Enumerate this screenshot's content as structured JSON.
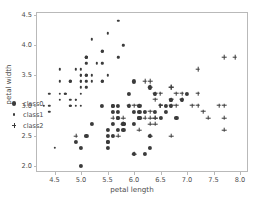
{
  "chart_data": {
    "type": "scatter",
    "title": "",
    "xlabel": "petal length",
    "ylabel": "petal width",
    "xlim": [
      4.15,
      8.15
    ],
    "ylim": [
      1.9,
      4.55
    ],
    "xticks": [
      "4.5",
      "5.0",
      "5.5",
      "6.0",
      "6.5",
      "7.0",
      "7.5",
      "8.0"
    ],
    "xtick_values": [
      4.5,
      5.0,
      5.5,
      6.0,
      6.5,
      7.0,
      7.5,
      8.0
    ],
    "yticks": [
      "2.0",
      "2.5",
      "3.0",
      "3.5",
      "4.0",
      "4.5"
    ],
    "ytick_values": [
      2.0,
      2.5,
      3.0,
      3.5,
      4.0,
      4.5
    ],
    "grid": false,
    "legend_position": "lower left",
    "marker_color": "#3b3b3b",
    "frame_color": "#b9b9b9",
    "series": [
      {
        "name": "class0",
        "marker": "circle",
        "points": [
          [
            7.0,
            3.2
          ],
          [
            6.4,
            3.2
          ],
          [
            6.9,
            3.1
          ],
          [
            5.5,
            2.3
          ],
          [
            6.5,
            2.8
          ],
          [
            5.7,
            2.8
          ],
          [
            6.3,
            3.3
          ],
          [
            4.9,
            2.4
          ],
          [
            6.6,
            2.9
          ],
          [
            5.2,
            2.7
          ],
          [
            5.0,
            2.0
          ],
          [
            5.9,
            3.0
          ],
          [
            6.0,
            2.2
          ],
          [
            6.1,
            2.9
          ],
          [
            5.6,
            2.9
          ],
          [
            6.7,
            3.1
          ],
          [
            5.6,
            3.0
          ],
          [
            5.8,
            2.7
          ],
          [
            6.2,
            2.2
          ],
          [
            5.6,
            2.5
          ],
          [
            5.9,
            3.2
          ],
          [
            6.1,
            2.8
          ],
          [
            6.3,
            2.5
          ],
          [
            6.1,
            2.8
          ],
          [
            6.4,
            2.9
          ],
          [
            6.6,
            3.0
          ],
          [
            6.8,
            2.8
          ],
          [
            6.7,
            3.0
          ],
          [
            6.0,
            2.9
          ],
          [
            5.7,
            2.6
          ],
          [
            5.5,
            2.4
          ],
          [
            5.5,
            2.4
          ],
          [
            5.8,
            2.7
          ],
          [
            6.0,
            2.7
          ],
          [
            5.4,
            3.0
          ],
          [
            6.0,
            3.4
          ],
          [
            6.7,
            3.1
          ],
          [
            6.3,
            2.3
          ],
          [
            5.6,
            3.0
          ],
          [
            5.5,
            2.5
          ],
          [
            5.5,
            2.6
          ],
          [
            6.1,
            3.0
          ],
          [
            5.8,
            2.6
          ],
          [
            5.0,
            2.3
          ],
          [
            5.6,
            2.7
          ],
          [
            5.7,
            3.0
          ],
          [
            5.7,
            2.9
          ],
          [
            6.2,
            2.9
          ],
          [
            5.1,
            2.5
          ],
          [
            5.7,
            2.8
          ]
        ]
      },
      {
        "name": "class1",
        "marker": "dot",
        "points": [
          [
            5.1,
            3.5
          ],
          [
            4.9,
            3.0
          ],
          [
            4.7,
            3.2
          ],
          [
            4.6,
            3.1
          ],
          [
            5.0,
            3.6
          ],
          [
            5.4,
            3.9
          ],
          [
            4.6,
            3.4
          ],
          [
            5.0,
            3.4
          ],
          [
            4.4,
            2.9
          ],
          [
            4.9,
            3.1
          ],
          [
            5.4,
            3.7
          ],
          [
            4.8,
            3.4
          ],
          [
            4.8,
            3.0
          ],
          [
            4.3,
            3.0
          ],
          [
            5.8,
            4.0
          ],
          [
            5.7,
            4.4
          ],
          [
            5.4,
            3.9
          ],
          [
            5.1,
            3.5
          ],
          [
            5.7,
            3.8
          ],
          [
            5.1,
            3.8
          ],
          [
            5.4,
            3.4
          ],
          [
            5.1,
            3.7
          ],
          [
            4.6,
            3.6
          ],
          [
            5.1,
            3.3
          ],
          [
            4.8,
            3.4
          ],
          [
            5.0,
            3.0
          ],
          [
            5.0,
            3.4
          ],
          [
            5.2,
            3.5
          ],
          [
            5.2,
            3.4
          ],
          [
            4.7,
            3.2
          ],
          [
            4.8,
            3.1
          ],
          [
            5.4,
            3.4
          ],
          [
            5.2,
            4.1
          ],
          [
            5.5,
            4.2
          ],
          [
            4.9,
            3.1
          ],
          [
            5.0,
            3.2
          ],
          [
            5.5,
            3.5
          ],
          [
            4.9,
            3.6
          ],
          [
            4.4,
            3.0
          ],
          [
            5.1,
            3.4
          ],
          [
            5.0,
            3.5
          ],
          [
            4.5,
            2.3
          ],
          [
            4.4,
            3.2
          ],
          [
            5.0,
            3.5
          ],
          [
            5.1,
            3.8
          ],
          [
            4.8,
            3.0
          ],
          [
            5.1,
            3.8
          ],
          [
            4.6,
            3.2
          ],
          [
            5.3,
            3.7
          ],
          [
            5.0,
            3.3
          ]
        ]
      },
      {
        "name": "class2",
        "marker": "plus",
        "points": [
          [
            6.3,
            3.3
          ],
          [
            5.8,
            2.7
          ],
          [
            7.1,
            3.0
          ],
          [
            6.3,
            2.9
          ],
          [
            6.5,
            3.0
          ],
          [
            7.6,
            3.0
          ],
          [
            4.9,
            2.5
          ],
          [
            7.3,
            2.9
          ],
          [
            6.7,
            2.5
          ],
          [
            7.2,
            3.6
          ],
          [
            6.5,
            3.2
          ],
          [
            6.4,
            2.7
          ],
          [
            6.8,
            3.0
          ],
          [
            5.7,
            2.5
          ],
          [
            5.8,
            2.8
          ],
          [
            6.4,
            3.2
          ],
          [
            6.5,
            3.0
          ],
          [
            7.7,
            3.8
          ],
          [
            7.7,
            2.6
          ],
          [
            6.0,
            2.2
          ],
          [
            6.9,
            3.2
          ],
          [
            5.6,
            2.8
          ],
          [
            7.7,
            2.8
          ],
          [
            6.3,
            2.7
          ],
          [
            6.7,
            3.3
          ],
          [
            7.2,
            3.2
          ],
          [
            6.2,
            2.8
          ],
          [
            6.1,
            3.0
          ],
          [
            6.4,
            2.8
          ],
          [
            7.2,
            3.0
          ],
          [
            7.4,
            2.8
          ],
          [
            7.9,
            3.8
          ],
          [
            6.4,
            2.8
          ],
          [
            6.3,
            2.8
          ],
          [
            6.1,
            2.6
          ],
          [
            7.7,
            3.0
          ],
          [
            6.3,
            3.4
          ],
          [
            6.4,
            3.1
          ],
          [
            6.0,
            3.0
          ],
          [
            6.9,
            3.1
          ],
          [
            6.7,
            3.1
          ],
          [
            6.9,
            3.1
          ],
          [
            5.8,
            2.7
          ],
          [
            6.8,
            3.2
          ],
          [
            6.7,
            3.3
          ],
          [
            6.7,
            3.0
          ],
          [
            6.3,
            2.5
          ],
          [
            6.5,
            3.0
          ],
          [
            6.2,
            3.4
          ],
          [
            5.9,
            3.0
          ]
        ]
      }
    ]
  },
  "legend": {
    "entries": [
      {
        "label": "class0"
      },
      {
        "label": "class1"
      },
      {
        "label": "class2"
      }
    ]
  }
}
